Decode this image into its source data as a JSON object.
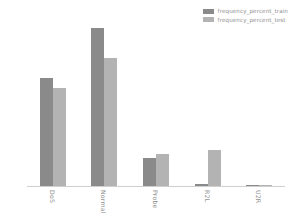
{
  "chart_data": {
    "type": "bar",
    "title": "",
    "xlabel": "",
    "ylabel": "",
    "categories": [
      "DoS",
      "Normal",
      "Probe",
      "R2L",
      "U2R"
    ],
    "series": [
      {
        "name": "frequency_percent_train",
        "color": "#8a8a8a",
        "values": [
          36.6,
          53.4,
          9.3,
          0.8,
          0.04
        ]
      },
      {
        "name": "frequency_percent_test",
        "color": "#b3b3b3",
        "values": [
          33.1,
          43.1,
          10.7,
          12.2,
          0.07
        ]
      }
    ],
    "ylim": [
      0,
      56
    ],
    "yticks": [
      0,
      10,
      20,
      30,
      40,
      50
    ],
    "ytick_labels": [
      "0",
      "10",
      "20",
      "30",
      "40",
      "50"
    ],
    "grid": false,
    "legend_position": "upper right",
    "xtick_rotation": 90
  }
}
